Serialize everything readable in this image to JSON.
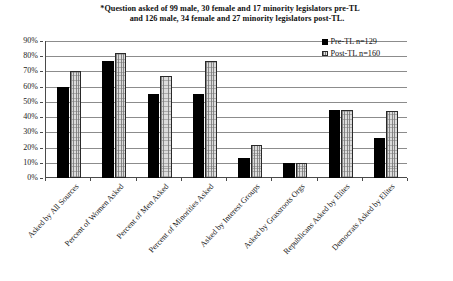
{
  "chart_data": {
    "type": "bar",
    "title": "*Question asked of  99 male,  30 female and 17 minority legislators  pre-TL and  126 male,  34 female and 27 minority legislators  post-TL.",
    "title_lines": [
      "*Question asked of  99 male,  30 female and 17 minority legislators  pre-TL",
      "and  126 male,  34 female and 27 minority legislators  post-TL."
    ],
    "xlabel": "",
    "ylabel": "",
    "ylim": [
      0,
      90
    ],
    "ytick_labels": [
      "90%",
      "80%",
      "70%",
      "60%",
      "50%",
      "40%",
      "30%",
      "20%",
      "10%",
      "0%"
    ],
    "ytick_values": [
      90,
      80,
      70,
      60,
      50,
      40,
      30,
      20,
      10,
      0
    ],
    "grid": true,
    "legend_position": "top-right",
    "categories": [
      "Asked by All Sources",
      "Percent of Women Asked",
      "Percent of Men Asked",
      "Percent of Minorities Asked",
      "Asked by Interest Groups",
      "Asked by Grassroots Orgs",
      "Republicans Asked by  Elites",
      "Democrats Asked by Elites"
    ],
    "series": [
      {
        "name": "Pre-TL n=129",
        "color": "#000000",
        "pattern": "solid",
        "values": [
          60,
          77,
          55,
          55,
          13,
          10,
          45,
          26
        ]
      },
      {
        "name": "Post-TL n=160",
        "color": "#dcdcdc",
        "pattern": "hatched",
        "values": [
          70,
          82,
          67,
          77,
          22,
          10,
          45,
          44
        ]
      }
    ]
  },
  "legend": {
    "items": [
      {
        "label": "Pre-TL n=129"
      },
      {
        "label": "Post-TL n=160"
      }
    ]
  }
}
